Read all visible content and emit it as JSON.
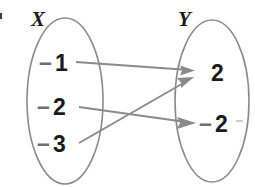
{
  "diagram": {
    "type": "mapping-diagram",
    "stroke_color": "#8a8a8a",
    "text_color": "#1a1a1a",
    "minus_color": "#6f6f6f",
    "background": "#ffffff",
    "sets": [
      {
        "id": "domain",
        "label": "X",
        "elements": [
          {
            "id": "x-neg1",
            "minus": "–",
            "value": "1",
            "display": "–1"
          },
          {
            "id": "x-neg2",
            "minus": "–",
            "value": "2",
            "display": "–2"
          },
          {
            "id": "x-neg3",
            "minus": "–",
            "value": "3",
            "display": "–3"
          }
        ]
      },
      {
        "id": "range",
        "label": "Y",
        "elements": [
          {
            "id": "y-pos2",
            "minus": "",
            "value": "2",
            "display": "2"
          },
          {
            "id": "y-neg2",
            "minus": "–",
            "value": "2",
            "display": "–2"
          }
        ]
      }
    ],
    "mappings": [
      {
        "id": "map-neg1-to-2",
        "from": "–1",
        "to": "2"
      },
      {
        "id": "map-neg2-to-neg2",
        "from": "–2",
        "to": "–2"
      },
      {
        "id": "map-neg3-to-2",
        "from": "–3",
        "to": "2"
      }
    ],
    "edge_fragment": "·"
  }
}
